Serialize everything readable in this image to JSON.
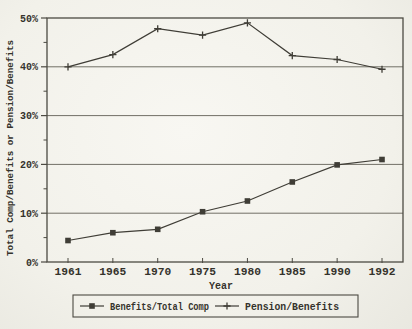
{
  "chart_data": {
    "type": "line",
    "title": "",
    "xlabel": "Year",
    "ylabel": "Total Comp/Benefits or Pension/Benefits",
    "categories": [
      "1961",
      "1965",
      "1970",
      "1975",
      "1980",
      "1985",
      "1990",
      "1992"
    ],
    "series": [
      {
        "name": "Benefits/Total Comp",
        "marker": "square",
        "values": [
          4.4,
          6.0,
          6.7,
          10.3,
          12.5,
          16.4,
          19.9,
          21.0
        ]
      },
      {
        "name": "Pension/Benefits",
        "marker": "plus",
        "values": [
          40.0,
          42.5,
          47.8,
          46.5,
          49.0,
          42.3,
          41.5,
          39.5
        ]
      }
    ],
    "ylim": [
      0,
      50
    ],
    "y_tick_values": [
      0,
      10,
      20,
      30,
      40,
      50
    ],
    "y_tick_labels": [
      "0%",
      "10%",
      "20%",
      "30%",
      "40%",
      "50%"
    ],
    "y_minor_tick_values": [
      5,
      15,
      25,
      35,
      45
    ],
    "gridline_values": [
      10,
      20,
      30,
      40
    ],
    "grid": "horizontal",
    "legend_position": "bottom"
  },
  "colors": {
    "background": "#f2f1ea",
    "line": "#3f3d36",
    "grid": "#716f66",
    "frame": "#4c4a42",
    "text": "#35332c"
  }
}
